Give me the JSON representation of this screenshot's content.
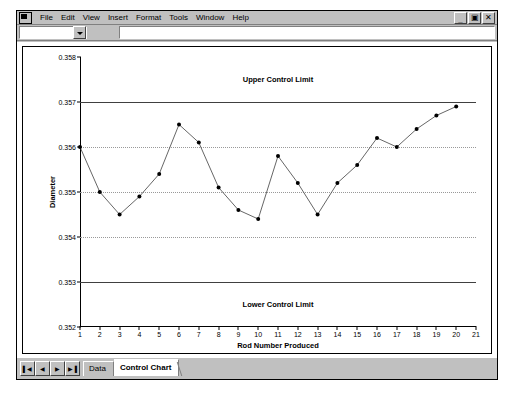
{
  "window": {
    "app_icon": "excel-app-icon",
    "menus": [
      {
        "label": "File",
        "accel": "F"
      },
      {
        "label": "Edit",
        "accel": "E"
      },
      {
        "label": "View",
        "accel": "V"
      },
      {
        "label": "Insert",
        "accel": "I"
      },
      {
        "label": "Format",
        "accel": "o"
      },
      {
        "label": "Tools",
        "accel": "T"
      },
      {
        "label": "Window",
        "accel": "W"
      },
      {
        "label": "Help",
        "accel": "H"
      }
    ],
    "controls": {
      "minimize": "_",
      "restore": "▣",
      "close": "✕"
    }
  },
  "formula_bar": {
    "name_box_value": "",
    "name_box_placeholder": "",
    "formula_value": "",
    "formula_placeholder": ""
  },
  "sheet_tabs": {
    "nav": [
      "▌◀",
      "◀",
      "▶",
      "▶▐"
    ],
    "tabs": [
      {
        "label": "Data",
        "active": false
      },
      {
        "label": "Control Chart",
        "active": true
      }
    ]
  },
  "chart_data": {
    "type": "line",
    "title": "",
    "xlabel": "Rod Number Produced",
    "ylabel": "Diameter",
    "xlim": [
      1,
      21
    ],
    "ylim": [
      0.352,
      0.358
    ],
    "ytick_step": 0.001,
    "yticks": [
      "0.358",
      "0.357",
      "0.356",
      "0.355",
      "0.354",
      "0.353",
      "0.352"
    ],
    "ytick_values": [
      0.358,
      0.357,
      0.356,
      0.355,
      0.354,
      0.353,
      0.352
    ],
    "xticks": [
      "1",
      "2",
      "3",
      "4",
      "5",
      "6",
      "7",
      "8",
      "9",
      "10",
      "11",
      "12",
      "13",
      "14",
      "15",
      "16",
      "17",
      "18",
      "19",
      "20",
      "21"
    ],
    "xtick_values": [
      1,
      2,
      3,
      4,
      5,
      6,
      7,
      8,
      9,
      10,
      11,
      12,
      13,
      14,
      15,
      16,
      17,
      18,
      19,
      20,
      21
    ],
    "gridlines": {
      "y_dotted": [
        0.356,
        0.355,
        0.354
      ],
      "x": false
    },
    "legend": "none",
    "marker": "filled-circle",
    "line_color": "#555555",
    "marker_color": "#000000",
    "control_limits": [
      {
        "name": "Upper Control Limit",
        "value": 0.357,
        "label_y": 0.3575
      },
      {
        "name": "Lower Control Limit",
        "value": 0.353,
        "label_y": 0.3525
      }
    ],
    "x": [
      1,
      2,
      3,
      4,
      5,
      6,
      7,
      8,
      9,
      10,
      11,
      12,
      13,
      14,
      15,
      16,
      17,
      18,
      19,
      20
    ],
    "values": [
      0.356,
      0.355,
      0.3545,
      0.3549,
      0.3554,
      0.3565,
      0.3561,
      0.3551,
      0.3546,
      0.3544,
      0.3558,
      0.3552,
      0.3545,
      0.3552,
      0.3556,
      0.3562,
      0.356,
      0.3564,
      0.3567,
      0.3569
    ],
    "series": [
      {
        "name": "Diameter",
        "values": [
          0.356,
          0.355,
          0.3545,
          0.3549,
          0.3554,
          0.3565,
          0.3561,
          0.3551,
          0.3546,
          0.3544,
          0.3558,
          0.3552,
          0.3545,
          0.3552,
          0.3556,
          0.3562,
          0.356,
          0.3564,
          0.3567,
          0.3569
        ]
      }
    ]
  }
}
